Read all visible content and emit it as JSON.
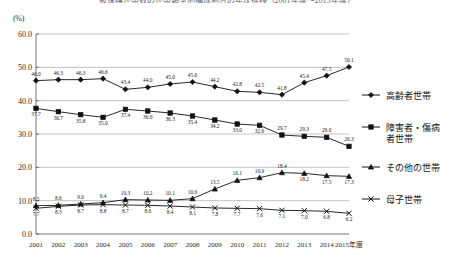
{
  "chart_data": {
    "type": "line",
    "title": "被保護世帯数の世帯類型別構成割合の年次推移（2001年度〜2015年度）",
    "xlabel": "",
    "ylabel": "(%)",
    "ylim": [
      0,
      60
    ],
    "yticks": [
      "0.0",
      "10.0",
      "20.0",
      "30.0",
      "40.0",
      "50.0",
      "60.0"
    ],
    "grid": true,
    "legend_position": "right",
    "x_axis_suffix": "年度",
    "categories": [
      "2001",
      "2002",
      "2003",
      "2004",
      "2005",
      "2006",
      "2007",
      "2008",
      "2009",
      "2010",
      "2011",
      "2012",
      "2013",
      "2014",
      "2015年度"
    ],
    "series": [
      {
        "name": "高齢者世帯",
        "marker": "diamond",
        "values": [
          46.0,
          46.3,
          46.3,
          46.6,
          43.4,
          44.0,
          45.0,
          45.6,
          44.2,
          42.8,
          42.5,
          41.8,
          45.4,
          47.5,
          50.1
        ]
      },
      {
        "name": "障害者・傷病者世帯",
        "marker": "square",
        "values": [
          37.7,
          36.7,
          35.8,
          35.0,
          37.4,
          36.9,
          36.3,
          35.4,
          34.2,
          33.0,
          32.6,
          29.7,
          29.3,
          29.0,
          26.3
        ]
      },
      {
        "name": "その他の世帯",
        "marker": "triangle",
        "values": [
          8.5,
          8.6,
          9.0,
          9.4,
          10.3,
          10.2,
          10.1,
          10.6,
          13.5,
          16.1,
          16.9,
          18.4,
          18.2,
          17.5,
          17.3
        ]
      },
      {
        "name": "母子世帯",
        "marker": "cross",
        "values": [
          7.7,
          8.3,
          8.7,
          8.8,
          8.7,
          8.6,
          8.4,
          8.1,
          7.8,
          7.7,
          7.6,
          7.1,
          7.0,
          6.8,
          6.2
        ]
      }
    ]
  }
}
